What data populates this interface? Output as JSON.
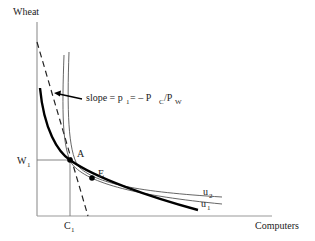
{
  "diagram": {
    "axes": {
      "y_label": "Wheat",
      "x_label": "Computers"
    },
    "ticks": {
      "w": "W",
      "w_sub": "1",
      "c": "C",
      "c_sub": "1"
    },
    "annotation": {
      "slope_prefix": "slope = p",
      "slope_p_sub": "1",
      "slope_mid": " = – P",
      "slope_pc_sub": "C",
      "slope_slash": "/P",
      "slope_pw_sub": "W"
    },
    "points": {
      "a": "A",
      "e": "E"
    },
    "curves": {
      "u2": "u",
      "u2_sub": "2",
      "u1": "u",
      "u1_sub": "1"
    },
    "colors": {
      "axis": "#999999",
      "curve_thin": "#555555",
      "curve_bold": "#000000",
      "text": "#222222"
    }
  }
}
